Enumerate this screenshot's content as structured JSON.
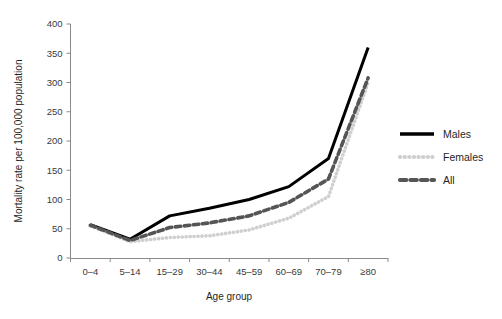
{
  "chart_data": {
    "type": "line",
    "title": "",
    "xlabel": "Age group",
    "ylabel": "Mortality rate per 100,000 population",
    "categories": [
      "0–4",
      "5–14",
      "15–29",
      "30–44",
      "45–59",
      "60–69",
      "70–79",
      "≥80"
    ],
    "ylim": [
      0,
      400
    ],
    "yticks": [
      0,
      50,
      100,
      150,
      200,
      250,
      300,
      350,
      400
    ],
    "ytick_labels": [
      "0",
      "50",
      "100",
      "150",
      "200",
      "250",
      "300",
      "350",
      "400"
    ],
    "grid": false,
    "legend_position": "right",
    "series": [
      {
        "name": "Males",
        "style": "solid",
        "color": "#000000",
        "values": [
          57,
          32,
          72,
          85,
          100,
          122,
          170,
          360
        ]
      },
      {
        "name": "Females",
        "style": "dotted",
        "color": "#cfcfcf",
        "values": [
          55,
          28,
          35,
          38,
          48,
          68,
          105,
          300
        ]
      },
      {
        "name": "All",
        "style": "dashed",
        "color": "#555555",
        "values": [
          56,
          30,
          52,
          60,
          72,
          95,
          135,
          308
        ]
      }
    ]
  },
  "legend": {
    "items": [
      {
        "label": "Males"
      },
      {
        "label": "Females"
      },
      {
        "label": "All"
      }
    ]
  },
  "axes": {
    "y_title": "Mortality rate per 100,000 population",
    "x_title": "Age group"
  }
}
